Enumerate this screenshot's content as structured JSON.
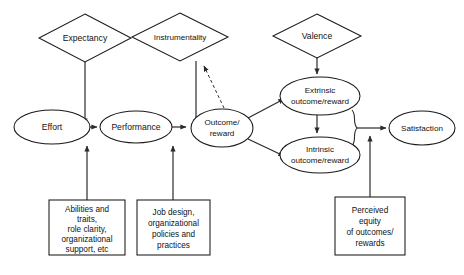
{
  "diagram": {
    "background_color": "#ffffff",
    "stroke_color": "#1a1a1a",
    "text_color": "#111111",
    "diamonds": [
      {
        "id": "expectancy",
        "label": "Expectancy",
        "cx": 85,
        "cy": 38,
        "rx": 46,
        "ry": 24
      },
      {
        "id": "instrumentality",
        "label": "Instrumentality",
        "cx": 180,
        "cy": 37,
        "rx": 48,
        "ry": 24
      },
      {
        "id": "valence",
        "label": "Valence",
        "cx": 317,
        "cy": 36,
        "rx": 44,
        "ry": 22
      }
    ],
    "ellipses": [
      {
        "id": "effort",
        "lines": [
          "Effort"
        ],
        "cx": 52,
        "cy": 127,
        "rx": 38,
        "ry": 17
      },
      {
        "id": "performance",
        "lines": [
          "Performance"
        ],
        "cx": 136,
        "cy": 127,
        "rx": 36,
        "ry": 16
      },
      {
        "id": "outcome-reward",
        "lines": [
          "Outcome/",
          "reward"
        ],
        "cx": 222,
        "cy": 128,
        "rx": 31,
        "ry": 19
      },
      {
        "id": "extrinsic-outcome-reward",
        "lines": [
          "Extrinsic",
          "outcome/reward"
        ],
        "cx": 320,
        "cy": 96,
        "rx": 40,
        "ry": 19
      },
      {
        "id": "intrinsic-outcome-reward",
        "lines": [
          "Intrinsic",
          "outcome/reward"
        ],
        "cx": 320,
        "cy": 155,
        "rx": 40,
        "ry": 18
      },
      {
        "id": "satisfaction",
        "lines": [
          "Satisfaction"
        ],
        "cx": 422,
        "cy": 128,
        "rx": 33,
        "ry": 17
      }
    ],
    "boxes": [
      {
        "id": "abilities-traits-box",
        "lines": [
          "Abilities and",
          "traits,",
          "role clarity,",
          "organizational",
          "support, etc"
        ],
        "x": 49,
        "y": 200,
        "w": 76,
        "h": 55
      },
      {
        "id": "job-design-box",
        "lines": [
          "Job design,",
          "organizational",
          "policies and",
          "practices"
        ],
        "x": 137,
        "y": 200,
        "w": 73,
        "h": 55
      },
      {
        "id": "perceived-equity-box",
        "lines": [
          "Perceived",
          "equity",
          "of outcomes/",
          "rewards"
        ],
        "x": 335,
        "y": 197,
        "w": 70,
        "h": 58
      }
    ],
    "connectors": [
      {
        "id": "expectancy-to-effort",
        "style": "solid",
        "arrow": true
      },
      {
        "id": "instrumentality-to-outcome",
        "style": "solid",
        "arrow": true
      },
      {
        "id": "valence-to-extrinsic",
        "style": "solid",
        "arrow": true
      },
      {
        "id": "effort-to-performance",
        "style": "solid",
        "arrow": true
      },
      {
        "id": "performance-to-outcome",
        "style": "solid",
        "arrow": true
      },
      {
        "id": "outcome-to-extrinsic",
        "style": "solid",
        "arrow": true
      },
      {
        "id": "outcome-to-intrinsic",
        "style": "solid",
        "arrow": true
      },
      {
        "id": "outcome-to-instrumentality-dashed",
        "style": "dashed",
        "arrow": true
      },
      {
        "id": "extrinsic-to-intrinsic",
        "style": "solid",
        "arrow": true
      },
      {
        "id": "rewards-brace-to-satisfaction",
        "style": "solid",
        "arrow": true
      },
      {
        "id": "abilities-box-to-effort",
        "style": "solid",
        "arrow": true
      },
      {
        "id": "job-design-box-to-performance",
        "style": "solid",
        "arrow": true
      },
      {
        "id": "perceived-equity-box-to-satisfaction",
        "style": "solid",
        "arrow": true
      }
    ]
  }
}
